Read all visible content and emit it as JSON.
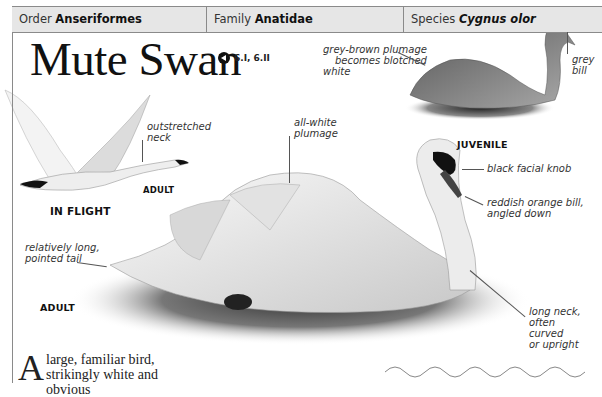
{
  "header": {
    "order": {
      "label": "Order",
      "value": "Anseriformes"
    },
    "family": {
      "label": "Family",
      "value": "Anatidae"
    },
    "species": {
      "label": "Species",
      "value": "Cygnus olor"
    }
  },
  "title": "Mute Swan",
  "audio": {
    "icon": "speaker-icon",
    "tracks": "6.I, 6.II"
  },
  "annotations": {
    "juvenile_plumage": [
      "grey-brown plumage",
      "becomes blotched",
      "white"
    ],
    "grey_bill": [
      "grey",
      "bill"
    ],
    "outstretched_neck": [
      "outstretched",
      "neck"
    ],
    "all_white": [
      "all-white",
      "plumage"
    ],
    "facial_knob": "black facial knob",
    "bill": [
      "reddish orange bill,",
      "angled down"
    ],
    "tail": [
      "relatively long,",
      "pointed tail"
    ],
    "neck": [
      "long neck,",
      "often curved",
      "or upright"
    ]
  },
  "labels": {
    "flight_adult": "ADULT",
    "in_flight": "IN FLIGHT",
    "juvenile": "JUVENILE",
    "adult": "ADULT"
  },
  "body": {
    "dropcap": "A",
    "line1": "large, familiar bird,",
    "line2": "strikingly white and obvious"
  }
}
